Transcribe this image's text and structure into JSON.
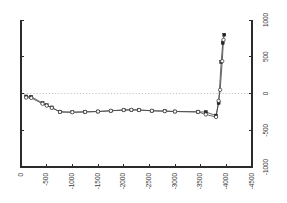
{
  "chart_data": {
    "type": "line",
    "title": "",
    "subtitle": "",
    "xlabel": "",
    "ylabel": "",
    "xlim": [
      0,
      -4500
    ],
    "ylim": [
      -1000,
      1000
    ],
    "grid": false,
    "zero_line": true,
    "legend": "none",
    "x_ticks": [
      0,
      -500,
      -1000,
      -1500,
      -2000,
      -2500,
      -3000,
      -3500,
      -4000,
      -4500
    ],
    "x_tick_labels": [
      "0",
      "-500",
      "-1000",
      "-1500",
      "-2000",
      "-2500",
      "-3000",
      "-3500",
      "-4000",
      "-4500"
    ],
    "x_tick_label_rotation": -90,
    "y_ticks": [
      1000,
      500,
      0,
      -500,
      -1000
    ],
    "y_tick_labels": [
      "1000",
      "500",
      "0",
      "-500",
      "-1000"
    ],
    "y_tick_label_rotation": -90,
    "y_axis_position": "right",
    "series": [
      {
        "name": "series-1",
        "marker": "square",
        "x": [
          -100,
          -200,
          -420,
          -500,
          -600,
          -760,
          -1000,
          -1250,
          -1500,
          -1750,
          -2000,
          -2150,
          -2300,
          -2550,
          -2800,
          -3000,
          -3450,
          -3600,
          -3800,
          -3850,
          -3900,
          -3930,
          -3960
        ],
        "values": [
          -40,
          -45,
          -130,
          -160,
          -190,
          -250,
          -255,
          -250,
          -245,
          -235,
          -225,
          -222,
          -225,
          -235,
          -240,
          -245,
          -250,
          -252,
          -300,
          -130,
          430,
          690,
          800
        ]
      },
      {
        "name": "series-2",
        "marker": "circle",
        "x": [
          -100,
          -200,
          -420,
          -500,
          -600,
          -760,
          -1000,
          -1250,
          -1500,
          -1750,
          -2000,
          -2150,
          -2300,
          -2550,
          -2800,
          -3000,
          -3450,
          -3600,
          -3800,
          -3850,
          -3880,
          -3920,
          -3945
        ],
        "values": [
          -55,
          -60,
          -140,
          -165,
          -195,
          -250,
          -255,
          -250,
          -245,
          -235,
          -225,
          -222,
          -225,
          -235,
          -240,
          -245,
          -250,
          -285,
          -320,
          -100,
          50,
          440,
          730
        ]
      }
    ]
  },
  "colors": {
    "axis": "#2b2b2b",
    "zero_line": "#b9b9b9",
    "series_line": "#4a4a4a",
    "marker_fill": "#262626",
    "background": "#ffffff"
  }
}
